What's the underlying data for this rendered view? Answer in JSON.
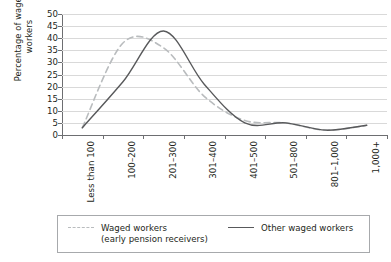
{
  "chart_data": {
    "type": "line",
    "title": "",
    "xlabel": "",
    "ylabel": "Percentage of waged\nworkers",
    "ylim": [
      0,
      50
    ],
    "yticks": [
      0,
      5,
      10,
      15,
      20,
      25,
      30,
      35,
      40,
      45,
      50
    ],
    "grid": true,
    "legend_position": "bottom",
    "categories": [
      "Less than 100",
      "100–200",
      "201–300",
      "301–400",
      "401–500",
      "501–800",
      "801–1,000",
      "1,000+"
    ],
    "series": [
      {
        "name": "Waged workers\n(early pension receivers)",
        "style": "dashed",
        "color": "#b9bcbe",
        "values": [
          3,
          38,
          36,
          16,
          6,
          5,
          2,
          4
        ]
      },
      {
        "name": "Other waged workers",
        "style": "solid",
        "color": "#58595b",
        "values": [
          3,
          22,
          43,
          21,
          5,
          5,
          2,
          4
        ]
      }
    ]
  },
  "legend": {
    "dashed_label": "Waged workers",
    "dashed_sub": "(early pension receivers)",
    "solid_label": "Other waged workers"
  }
}
